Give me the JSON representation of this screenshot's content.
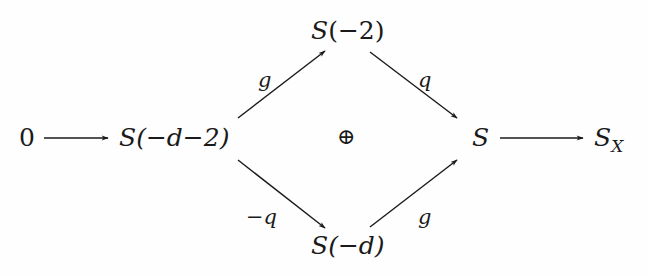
{
  "diagram": {
    "type": "commutative-diagram",
    "nodes": {
      "zero": {
        "text": "0"
      },
      "source": {
        "base": "S",
        "arg": "(−d−2)"
      },
      "top": {
        "base": "S",
        "arg": "(−2)"
      },
      "bottom": {
        "base": "S",
        "arg": "(−d)"
      },
      "target": {
        "base": "S"
      },
      "quotient": {
        "base": "S",
        "sub": "X"
      },
      "center": {
        "text": "⊕"
      }
    },
    "edges": [
      {
        "from": "zero",
        "to": "source",
        "label": ""
      },
      {
        "from": "source",
        "to": "top",
        "label": "g"
      },
      {
        "from": "source",
        "to": "bottom",
        "label": "−q"
      },
      {
        "from": "top",
        "to": "target",
        "label": "q"
      },
      {
        "from": "bottom",
        "to": "target",
        "label": "g"
      },
      {
        "from": "target",
        "to": "quotient",
        "label": ""
      }
    ],
    "colors": {
      "ink": "#1a1a1a",
      "background": "#fefefe"
    }
  }
}
